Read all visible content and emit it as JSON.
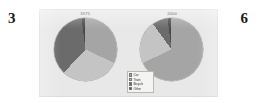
{
  "page": {
    "number_left": "3",
    "number_right": "6"
  },
  "figure": {
    "background_color": "#e8e8e8",
    "legend": {
      "entries": [
        {
          "label": "Car",
          "color": "#a5a5a5"
        },
        {
          "label": "Train",
          "color": "#c4c4c4"
        },
        {
          "label": "Bicycle",
          "color": "#6b6b6b"
        },
        {
          "label": "Other",
          "color": "#4a4a4a"
        }
      ]
    }
  },
  "chart_data": [
    {
      "type": "pie",
      "title": "1975",
      "categories": [
        "Car",
        "Train",
        "Bicycle",
        "Other"
      ],
      "values": [
        32,
        30,
        36,
        2
      ],
      "colors": [
        "#a5a5a5",
        "#c4c4c4",
        "#6b6b6b",
        "#4a4a4a"
      ],
      "start_angle": 0,
      "legend": "shared",
      "units": "percent"
    },
    {
      "type": "pie",
      "title": "2000",
      "categories": [
        "Car",
        "Train",
        "Bicycle",
        "Other"
      ],
      "values": [
        68,
        22,
        8,
        2
      ],
      "colors": [
        "#a5a5a5",
        "#c4c4c4",
        "#6b6b6b",
        "#4a4a4a"
      ],
      "start_angle": 0,
      "legend": "shared",
      "units": "percent"
    }
  ]
}
